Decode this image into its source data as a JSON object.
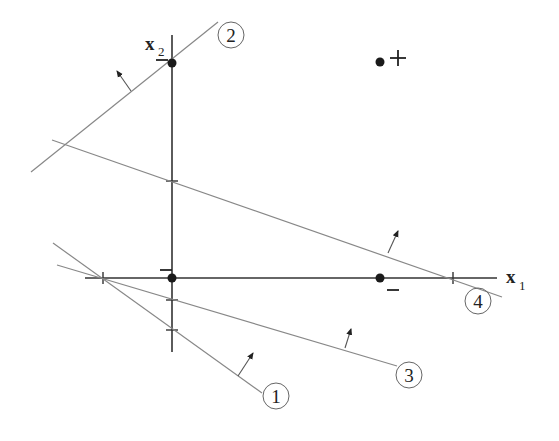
{
  "figure": {
    "axes": {
      "x_label": "x",
      "x_sub": "1",
      "y_label": "x",
      "y_sub": "2"
    },
    "points": [
      {
        "name": "positive-point",
        "label": "+",
        "x": 380,
        "y": 62
      },
      {
        "name": "negative-point",
        "label": "−",
        "x": 380,
        "y": 278
      },
      {
        "name": "origin-point",
        "label": "",
        "x": 172,
        "y": 278
      },
      {
        "name": "top-point",
        "label": "",
        "x": 172,
        "y": 63
      }
    ],
    "lines": [
      {
        "id": "1",
        "label": "1"
      },
      {
        "id": "2",
        "label": "2"
      },
      {
        "id": "3",
        "label": "3"
      },
      {
        "id": "4",
        "label": "4"
      }
    ],
    "colors": {
      "axis": "#333333",
      "line": "#888888",
      "point": "#1a1a1a"
    }
  }
}
